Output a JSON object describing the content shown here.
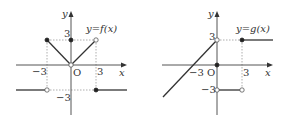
{
  "graphs": [
    {
      "name": "f",
      "label": "y=f(x)",
      "axis_x": "x",
      "axis_y": "y",
      "origin": "O",
      "ticks": {
        "neg_x": "−3",
        "pos_x": "3",
        "pos_y": "3",
        "neg_y": "−3"
      },
      "pieces": [
        {
          "domain": "x < -3",
          "value": "-3",
          "endpoint": "open at (-3,-3)"
        },
        {
          "domain": "-3 <= x < 0",
          "value": "-x",
          "endpoint": "filled at (-3,3)"
        },
        {
          "domain": "x = 0",
          "value": "3",
          "endpoint": "filled at (0,3), open at (0,0)"
        },
        {
          "domain": "0 < x < 3",
          "value": "x",
          "endpoint": "open at (3,3)"
        },
        {
          "domain": "x >= 3",
          "value": "-3",
          "endpoint": "filled at (3,-3)"
        }
      ]
    },
    {
      "name": "g",
      "label": "y=g(x)",
      "axis_x": "x",
      "axis_y": "y",
      "origin": "O",
      "ticks": {
        "neg_x": "−3",
        "pos_x": "3",
        "pos_y": "3",
        "neg_y": "−3"
      },
      "pieces": [
        {
          "domain": "x < 0",
          "value": "x+3",
          "endpoint": "open at (0,3)"
        },
        {
          "domain": "x = 0",
          "value": "0",
          "endpoint": "filled at (0,0)"
        },
        {
          "domain": "0 < x < 3",
          "value": "-3",
          "endpoint": "open at (0,-3) and (3,-3)"
        },
        {
          "domain": "x >= 3",
          "value": "3",
          "endpoint": "filled at (3,3)"
        }
      ]
    }
  ]
}
